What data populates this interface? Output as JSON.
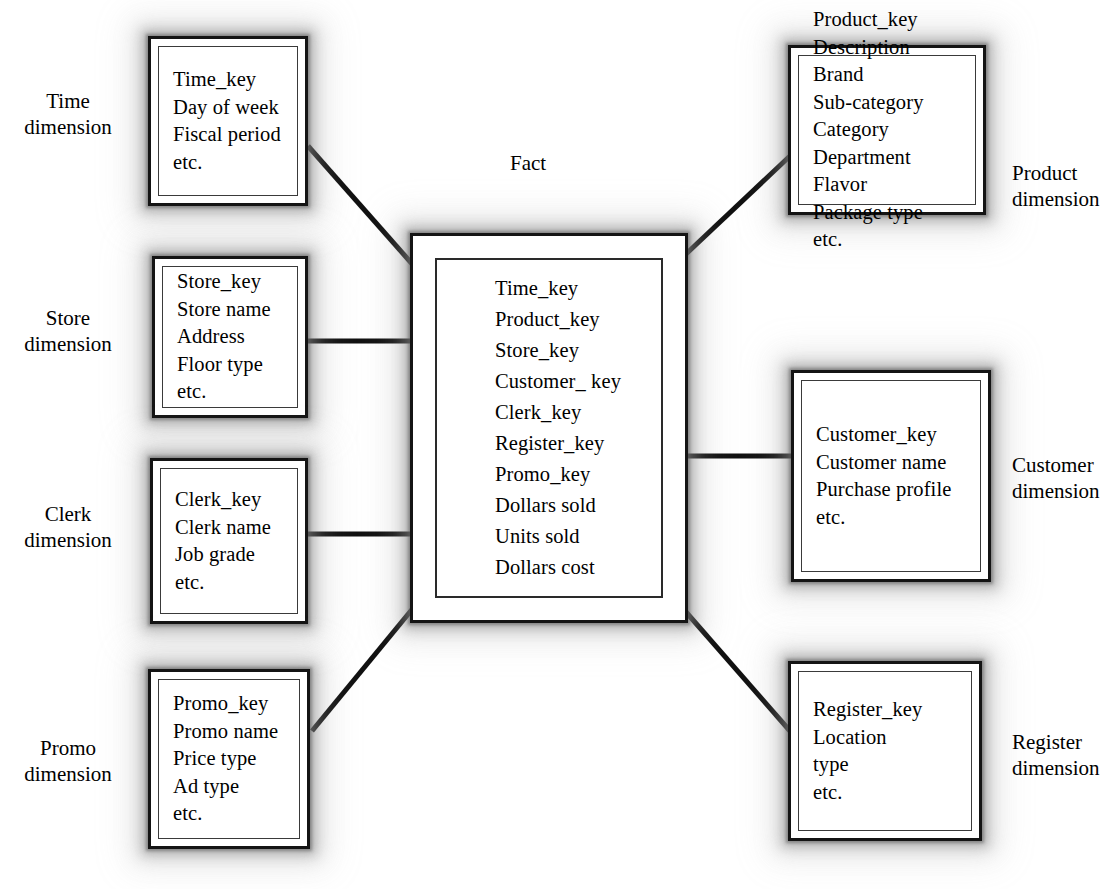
{
  "diagram": {
    "type": "star-schema",
    "fact_label": "Fact",
    "fact_table": {
      "name": "Fact",
      "fields": [
        "Time_key",
        "Product_key",
        "Store_key",
        "Customer_ key",
        "Clerk_key",
        "Register_key",
        "Promo_key",
        "Dollars sold",
        "Units sold",
        "Dollars cost"
      ]
    },
    "dimensions": [
      {
        "id": "time",
        "label_line1": "Time",
        "label_line2": "dimension",
        "side": "left",
        "fields": [
          "Time_key",
          "Day of week",
          "Fiscal period",
          "etc."
        ]
      },
      {
        "id": "store",
        "label_line1": "Store",
        "label_line2": "dimension",
        "side": "left",
        "fields": [
          "Store_key",
          "Store name",
          "Address",
          "Floor type",
          "etc."
        ]
      },
      {
        "id": "clerk",
        "label_line1": "Clerk",
        "label_line2": "dimension",
        "side": "left",
        "fields": [
          "Clerk_key",
          "Clerk name",
          "Job grade",
          "etc."
        ]
      },
      {
        "id": "promo",
        "label_line1": "Promo",
        "label_line2": "dimension",
        "side": "left",
        "fields": [
          "Promo_key",
          "Promo name",
          "Price type",
          "Ad type",
          "etc."
        ]
      },
      {
        "id": "product",
        "label_line1": "Product",
        "label_line2": "dimension",
        "side": "right",
        "fields": [
          "Product_key",
          "Description",
          "Brand",
          "Sub-category",
          "Category",
          "Department",
          "Flavor",
          "Package type",
          "etc."
        ]
      },
      {
        "id": "customer",
        "label_line1": "Customer",
        "label_line2": "dimension",
        "side": "right",
        "fields": [
          "Customer_key",
          "Customer name",
          "Purchase profile",
          "etc."
        ]
      },
      {
        "id": "register",
        "label_line1": "Register",
        "label_line2": "dimension",
        "side": "right",
        "fields": [
          "Register_key",
          "Location",
          "type",
          "etc."
        ]
      }
    ],
    "colors": {
      "background": "#ffffff",
      "border": "#141414",
      "text": "#000000",
      "connector": "#111111",
      "shadow": "#9a9a9a"
    }
  }
}
